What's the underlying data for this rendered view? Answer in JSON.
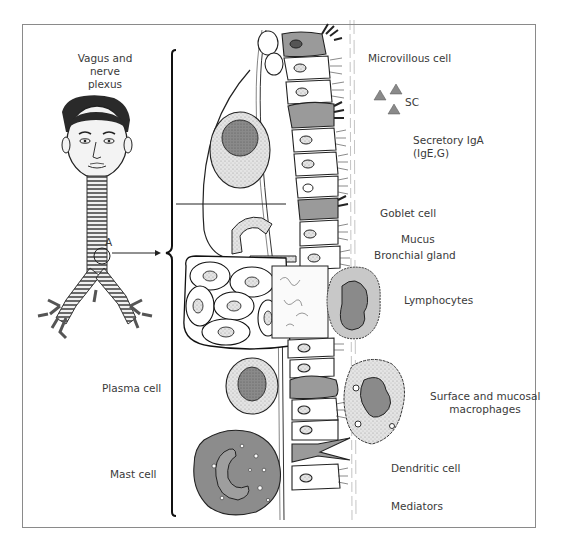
{
  "diagram": {
    "left_labels": {
      "vagus": [
        "Vagus and",
        "nerve",
        "plexus"
      ],
      "a_marker": "A",
      "plasma_cell": "Plasma cell",
      "mast_cell": "Mast cell"
    },
    "right_labels": {
      "microvillous_cell": "Microvillous cell",
      "sc": "SC",
      "secretory_iga": [
        "Secretory IgA",
        "(IgE,G)"
      ],
      "goblet_cell": "Goblet cell",
      "mucus": "Mucus",
      "bronchial_gland": "Bronchial gland",
      "lymphocytes": "Lymphocytes",
      "macrophages": [
        "Surface and mucosal",
        "macrophages"
      ],
      "dendritic_cell": "Dendritic cell",
      "mediators": "Mediators"
    },
    "colors": {
      "line": "#1a1a1a",
      "gray_cell": "#9a9a9a",
      "light_gray": "#d4d4d4",
      "dark_nucleus": "#7a7a7a",
      "frame": "#8a8a8a",
      "hair": "#3d3d3d"
    }
  }
}
